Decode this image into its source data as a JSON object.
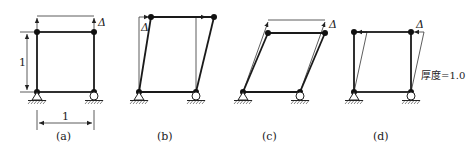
{
  "figure": {
    "panels": [
      {
        "id": "a",
        "label": "(a)",
        "delta_label": "Δ",
        "height_label": "1",
        "width_label": "1"
      },
      {
        "id": "b",
        "label": "(b)",
        "delta_label": "Δ"
      },
      {
        "id": "c",
        "label": "(c)",
        "delta_label": "Δ"
      },
      {
        "id": "d",
        "label": "(d)",
        "delta_label": "Δ",
        "note": "厚度=1.0"
      }
    ]
  }
}
